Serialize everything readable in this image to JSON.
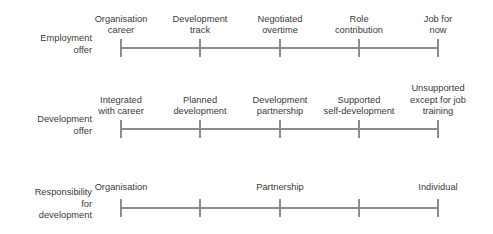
{
  "diagram": {
    "line_color": "#8c8c8c",
    "text_color": "#3a3a3a",
    "background": "#ffffff",
    "rows": [
      {
        "id": "employment-offer",
        "label": "Employment\noffer",
        "axis_y": 47,
        "label_y": 33,
        "labels_valign": "bottom",
        "label_block_top": 5,
        "label_block_height": 32,
        "points": [
          {
            "x": 121,
            "text": "Organisation\ncareer"
          },
          {
            "x": 200,
            "text": "Development\ntrack"
          },
          {
            "x": 280,
            "text": "Negotiated\novertime"
          },
          {
            "x": 359,
            "text": "Role\ncontribution"
          },
          {
            "x": 438,
            "text": "Job for\nnow"
          }
        ]
      },
      {
        "id": "development-offer",
        "label": "Development\noffer",
        "axis_y": 128,
        "label_y": 114,
        "labels_valign": "bottom",
        "label_block_top": 82,
        "label_block_height": 36,
        "points": [
          {
            "x": 121,
            "text": "Integrated\nwith career"
          },
          {
            "x": 200,
            "text": "Planned\ndevelopment"
          },
          {
            "x": 280,
            "text": "Development\npartnership"
          },
          {
            "x": 359,
            "text": "Supported\nself-development"
          },
          {
            "x": 438,
            "text": "Unsupported\nexcept for job\ntraining"
          }
        ]
      },
      {
        "id": "responsibility-for-development",
        "label": "Responsibility\nfor\ndevelopment",
        "axis_y": 207,
        "label_y": 187,
        "labels_valign": "bottom",
        "label_block_top": 174,
        "label_block_height": 20,
        "points": [
          {
            "x": 121,
            "text": "Organisation"
          },
          {
            "x": 200,
            "text": ""
          },
          {
            "x": 280,
            "text": "Partnership"
          },
          {
            "x": 359,
            "text": ""
          },
          {
            "x": 438,
            "text": "Individual"
          }
        ]
      }
    ]
  }
}
